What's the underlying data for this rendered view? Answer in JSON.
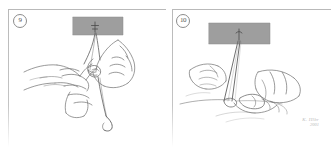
{
  "figure": {
    "background_color": "#ffffff",
    "ink_color": "#6f6f6f",
    "block_color": "#9e9e9e",
    "frame_color": "#b9b9b9"
  },
  "panels": [
    {
      "step_number": "9",
      "caption": "",
      "instrument_block": {
        "label": "",
        "marker": "needle-entry-cross"
      },
      "scene": "two hands tying a suture knot, thread descending to curved needle"
    },
    {
      "step_number": "10",
      "caption": "",
      "instrument_block": {
        "label": "",
        "marker": "needle-entry-point"
      },
      "scene": "hands drawing two suture strands taut into a V toward the tissue"
    }
  ],
  "signature": {
    "name": "K. Hlbr",
    "year": "2001"
  }
}
